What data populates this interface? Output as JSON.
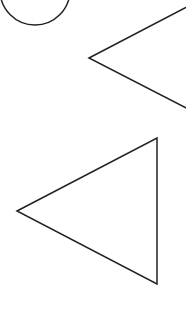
{
  "canvas": {
    "width": 186,
    "height": 321,
    "background": "#ffffff",
    "stroke_color": "#222222",
    "stroke_width": 1.5
  },
  "shapes": [
    {
      "id": "circle-partial",
      "type": "circle",
      "cx": 35,
      "cy": -10,
      "r": 35
    },
    {
      "id": "triangle-upper",
      "type": "polygon",
      "points": [
        [
          89,
          58
        ],
        [
          200,
          0
        ],
        [
          200,
          115
        ]
      ]
    },
    {
      "id": "triangle-lower",
      "type": "polygon",
      "points": [
        [
          17,
          211
        ],
        [
          157,
          138
        ],
        [
          157,
          284
        ]
      ]
    }
  ]
}
